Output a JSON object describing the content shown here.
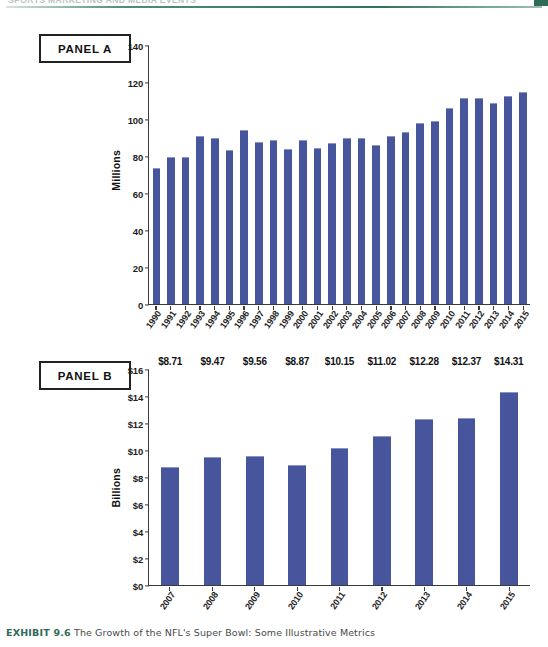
{
  "page": {
    "running_head": "SPORTS MARKETING AND MEDIA EVENTS",
    "caption_label": "EXHIBIT 9.6",
    "caption_text": "The Growth of the NFL's Super Bowl: Some Illustrative Metrics"
  },
  "panel_a": {
    "tag": "PANEL A"
  },
  "panel_b": {
    "tag": "PANEL B"
  },
  "colors": {
    "bar_blue": "#46559c",
    "bar_highlight": "#8b95c4",
    "axis": "#3a3a3a",
    "rule_green": "#35705c",
    "caption_green": "#2f6b57"
  },
  "chart_data": [
    {
      "type": "bar",
      "panel": "PANEL A",
      "title": "",
      "xlabel": "",
      "ylabel": "Millions",
      "ylim": [
        0,
        140
      ],
      "yticks": [
        0,
        20,
        40,
        60,
        80,
        100,
        120,
        140
      ],
      "ytick_labels": [
        "0",
        "20",
        "40",
        "60",
        "80",
        "100",
        "120",
        "140"
      ],
      "grid": false,
      "legend": "none",
      "categories": [
        "1990",
        "1991",
        "1992",
        "1993",
        "1994",
        "1995",
        "1996",
        "1997",
        "1998",
        "1999",
        "2000",
        "2001",
        "2002",
        "2003",
        "2004",
        "2005",
        "2006",
        "2007",
        "2008",
        "2009",
        "2010",
        "2011",
        "2012",
        "2013",
        "2014",
        "2015"
      ],
      "values": [
        73.5,
        79.0,
        79.0,
        90.5,
        89.5,
        83.0,
        94.0,
        87.5,
        88.5,
        83.7,
        88.5,
        84.3,
        86.8,
        89.4,
        89.8,
        86.0,
        90.7,
        93.0,
        97.5,
        98.7,
        106.0,
        111.0,
        111.3,
        108.7,
        112.2,
        114.4
      ],
      "value_labels_shown": false
    },
    {
      "type": "bar",
      "panel": "PANEL B",
      "title": "",
      "xlabel": "",
      "ylabel": "Billions",
      "ylim": [
        0,
        16
      ],
      "yticks": [
        0,
        2,
        4,
        6,
        8,
        10,
        12,
        14,
        16
      ],
      "ytick_labels": [
        "$0",
        "$2",
        "$4",
        "$6",
        "$8",
        "$10",
        "$12",
        "$14",
        "$16"
      ],
      "grid": false,
      "legend": "none",
      "categories": [
        "2007",
        "2008",
        "2009",
        "2010",
        "2011",
        "2012",
        "2013",
        "2014",
        "2015"
      ],
      "values": [
        8.71,
        9.47,
        9.56,
        8.87,
        10.15,
        11.02,
        12.28,
        12.37,
        14.31
      ],
      "value_labels_shown": true,
      "value_labels": [
        "$8.71",
        "$9.47",
        "$9.56",
        "$8.87",
        "$10.15",
        "$11.02",
        "$12.28",
        "$12.37",
        "$14.31"
      ]
    }
  ]
}
